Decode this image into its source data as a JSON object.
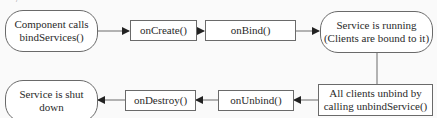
{
  "diagram": {
    "type": "flowchart",
    "topic": "Bound service lifecycle",
    "nodes": [
      {
        "id": "start",
        "shape": "rounded",
        "label": "Component calls bindServices()",
        "lines": [
          "Component calls",
          "bindServices()"
        ]
      },
      {
        "id": "oncreate",
        "shape": "rect",
        "label": "onCreate()"
      },
      {
        "id": "onbind",
        "shape": "rect",
        "label": "onBind()"
      },
      {
        "id": "running",
        "shape": "rounded",
        "label": "Service is running (Clients are bound to it)",
        "lines": [
          "Service is running",
          "(Clients are bound to it)"
        ]
      },
      {
        "id": "unbind",
        "shape": "rect",
        "label": "All clients unbind by calling unbindService()",
        "lines": [
          "All clients unbind by",
          "calling unbindService()"
        ]
      },
      {
        "id": "onunbind",
        "shape": "rect",
        "label": "onUnbind()"
      },
      {
        "id": "ondestroy",
        "shape": "rect",
        "label": "onDestroy()"
      },
      {
        "id": "shutdown",
        "shape": "rounded",
        "label": "Service is shut down",
        "lines": [
          "Service is shut",
          "down"
        ]
      }
    ],
    "edges": [
      {
        "from": "start",
        "to": "oncreate"
      },
      {
        "from": "oncreate",
        "to": "onbind"
      },
      {
        "from": "onbind",
        "to": "running"
      },
      {
        "from": "running",
        "to": "unbind"
      },
      {
        "from": "unbind",
        "to": "onunbind"
      },
      {
        "from": "onunbind",
        "to": "ondestroy"
      },
      {
        "from": "ondestroy",
        "to": "shutdown"
      }
    ]
  },
  "colors": {
    "stroke": "#6a6a6a",
    "fill": "#ffffff",
    "background": "#fafafa",
    "text": "#2a2a2a",
    "arrow": "#222222"
  }
}
